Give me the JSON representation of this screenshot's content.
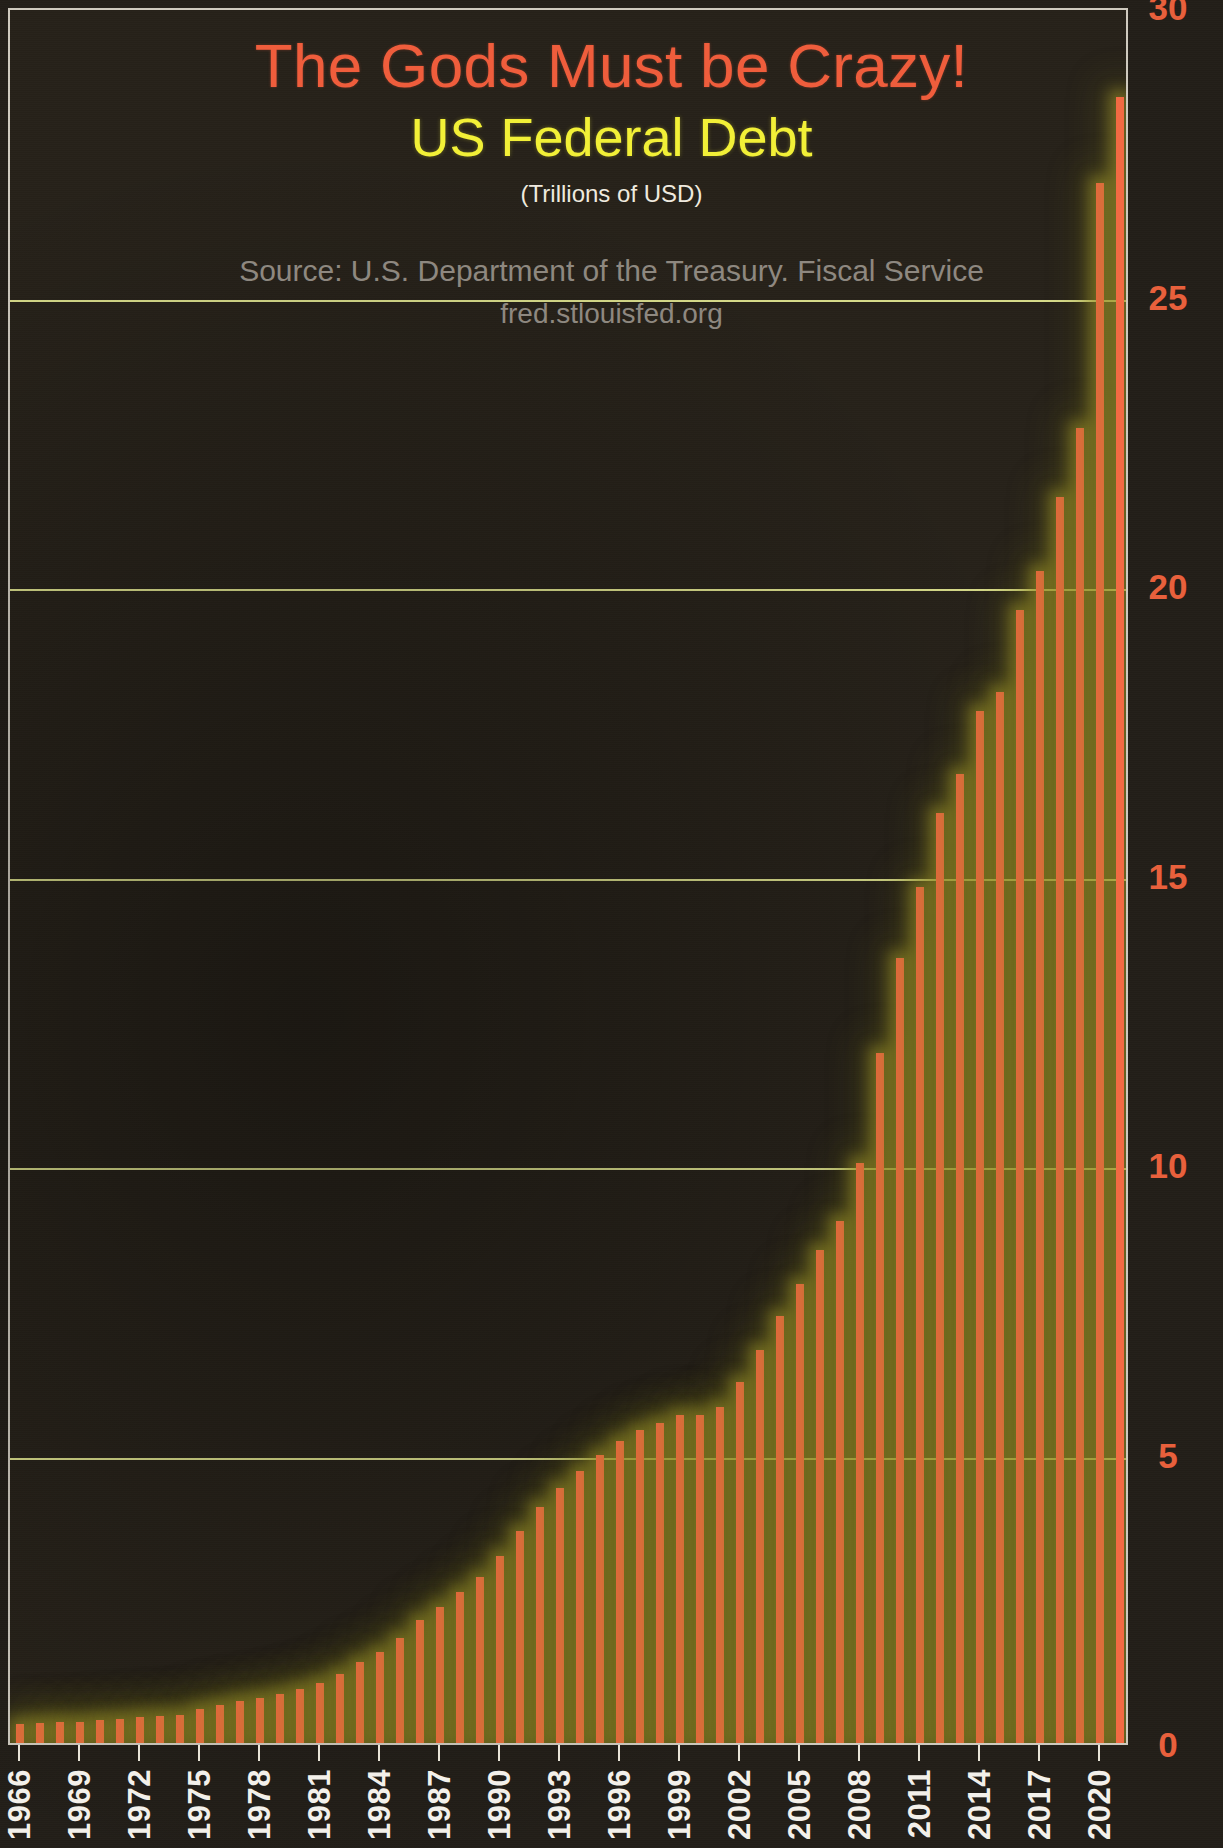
{
  "titles": {
    "main": "The Gods Must be Crazy!",
    "sub": "US Federal Debt",
    "units": "(Trillions of USD)"
  },
  "source": {
    "line": "Source: U.S. Department of the Treasury. Fiscal Service",
    "url": "fred.stlouisfed.org"
  },
  "colors": {
    "bar": "#f26a43",
    "glow": "#a89e2e",
    "title": "#ef5d3c",
    "subtitle": "#f2f037",
    "axis_label": "#e8603c",
    "background": "#221e18",
    "gridline": "#e8e4d8",
    "xtick_label": "#f3f0ea",
    "source_text": "#8e8880"
  },
  "chart_data": {
    "type": "bar",
    "title": "The Gods Must be Crazy! US Federal Debt",
    "subtitle": "(Trillions of USD)",
    "xlabel": "",
    "ylabel": "",
    "ylim": [
      0,
      30
    ],
    "yticks": [
      0,
      5,
      10,
      15,
      20,
      25,
      30
    ],
    "ytick_labels": [
      "0",
      "5",
      "10",
      "15",
      "20",
      "25",
      "30"
    ],
    "grid": true,
    "legend": null,
    "xtick_labels": [
      "1966",
      "1969",
      "1972",
      "1975",
      "1978",
      "1981",
      "1984",
      "1987",
      "1990",
      "1993",
      "1996",
      "1999",
      "2002",
      "2005",
      "2008",
      "2011",
      "2014",
      "2017",
      "2020"
    ],
    "xtick_interval_years": 3,
    "categories": [
      "1966",
      "1967",
      "1968",
      "1969",
      "1970",
      "1971",
      "1972",
      "1973",
      "1974",
      "1975",
      "1976",
      "1977",
      "1978",
      "1979",
      "1980",
      "1981",
      "1982",
      "1983",
      "1984",
      "1985",
      "1986",
      "1987",
      "1988",
      "1989",
      "1990",
      "1991",
      "1992",
      "1993",
      "1994",
      "1995",
      "1996",
      "1997",
      "1998",
      "1999",
      "2000",
      "2001",
      "2002",
      "2003",
      "2004",
      "2005",
      "2006",
      "2007",
      "2008",
      "2009",
      "2010",
      "2011",
      "2012",
      "2013",
      "2014",
      "2015",
      "2016",
      "2017",
      "2018",
      "2019",
      "2020",
      "2021"
    ],
    "values": [
      0.32,
      0.34,
      0.37,
      0.37,
      0.39,
      0.42,
      0.45,
      0.47,
      0.49,
      0.58,
      0.65,
      0.72,
      0.78,
      0.84,
      0.93,
      1.03,
      1.2,
      1.4,
      1.57,
      1.82,
      2.13,
      2.35,
      2.6,
      2.86,
      3.23,
      3.67,
      4.07,
      4.41,
      4.69,
      4.97,
      5.22,
      5.41,
      5.53,
      5.66,
      5.67,
      5.81,
      6.23,
      6.78,
      7.38,
      7.93,
      8.51,
      9.01,
      10.02,
      11.91,
      13.56,
      14.79,
      16.07,
      16.74,
      17.82,
      18.15,
      19.57,
      20.24,
      21.52,
      22.72,
      26.95,
      28.43
    ]
  }
}
